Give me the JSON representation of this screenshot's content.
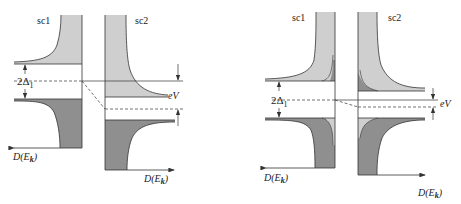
{
  "figure": {
    "colors": {
      "light_fill": "#cfcfcf",
      "dark_fill": "#8f8f8f",
      "stroke": "#333333",
      "background": "#ffffff"
    },
    "panels": [
      {
        "id": "left",
        "label_sc1": "sc1",
        "label_sc2": "sc2",
        "gap_label_main": "2Δ",
        "gap_label_sub": "1",
        "bias_label": "eV",
        "axis_label_left_main": "D(E",
        "axis_label_left_sub": "k",
        "axis_label_left_close": ")",
        "axis_label_right_main": "D(E",
        "axis_label_right_sub": "k",
        "axis_label_right_close": ")"
      },
      {
        "id": "right",
        "label_sc1": "sc1",
        "label_sc2": "sc2",
        "gap_label_main": "2Δ",
        "gap_label_sub": "1",
        "bias_label": "eV",
        "axis_label_left_main": "D(E",
        "axis_label_left_sub": "k",
        "axis_label_left_close": ")",
        "axis_label_right_main": "D(E",
        "axis_label_right_sub": "k",
        "axis_label_right_close": ")"
      }
    ]
  }
}
